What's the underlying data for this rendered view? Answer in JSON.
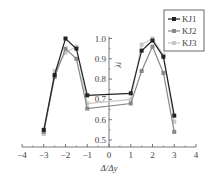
{
  "chart_data": {
    "type": "line",
    "title": "",
    "xlabel": "Δ/Δy",
    "ylabel": "λi",
    "xlim": [
      -4,
      4
    ],
    "ylim": [
      0.5,
      1.0
    ],
    "xticks": [
      "-4",
      "-3",
      "-2",
      "-1",
      "0",
      "1",
      "2",
      "3",
      "4"
    ],
    "yticks": [
      "0.5",
      "0.6",
      "0.7",
      "0.8",
      "0.9",
      "1.0"
    ],
    "grid": false,
    "legend_position": "upper right",
    "series": [
      {
        "name": "KJ1",
        "color": "#222222",
        "marker": "square",
        "x": [
          -3,
          -2.5,
          -2,
          -1.5,
          -1,
          1,
          1.5,
          2,
          2.5,
          3
        ],
        "y": [
          0.55,
          0.82,
          1.0,
          0.95,
          0.72,
          0.73,
          0.94,
          0.99,
          0.91,
          0.62
        ]
      },
      {
        "name": "KJ2",
        "color": "#888888",
        "marker": "circle",
        "x": [
          -3,
          -2.5,
          -2,
          -1.5,
          -1,
          1,
          1.5,
          2,
          2.5,
          3
        ],
        "y": [
          0.54,
          0.81,
          0.95,
          0.9,
          0.655,
          0.68,
          0.84,
          0.96,
          0.83,
          0.54
        ]
      },
      {
        "name": "KJ3",
        "color": "#c8c8c8",
        "marker": "triangle",
        "x": [
          -3,
          -2.5,
          -2,
          -1.5,
          -1,
          1,
          1.5,
          2,
          2.5,
          3
        ],
        "y": [
          0.53,
          0.84,
          0.93,
          0.96,
          0.68,
          0.7,
          0.97,
          1.0,
          0.92,
          0.59
        ]
      }
    ]
  }
}
